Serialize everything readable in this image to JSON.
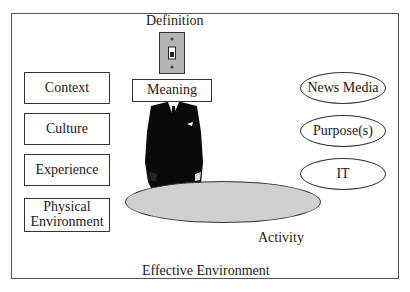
{
  "diagram": {
    "top_label": "Definition",
    "head_label": "Meaning",
    "left_boxes": [
      "Context",
      "Culture",
      "Experience",
      "Physical Environment"
    ],
    "left_box_lines": [
      [
        "Context"
      ],
      [
        "Culture"
      ],
      [
        "Experience"
      ],
      [
        "Physical",
        "Environment"
      ]
    ],
    "right_ovals": [
      "News Media",
      "Purpose(s)",
      "IT"
    ],
    "platform_label": "Activity",
    "frame_label": "Effective Environment",
    "icons": {
      "switch": "light-switch-icon",
      "figure": "business-suit-figure"
    },
    "colors": {
      "switch_plate": "#b5b5b5",
      "platform": "#d0d0d0",
      "suit": "#0a0a0a",
      "border": "#333333"
    }
  }
}
